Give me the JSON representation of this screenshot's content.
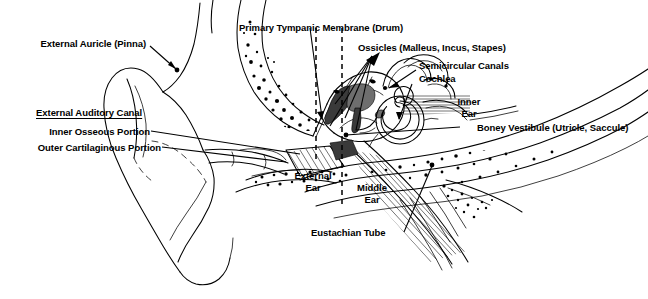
{
  "figure": {
    "background_color": "#ffffff",
    "ink_color": "#000000",
    "width": 648,
    "height": 299
  },
  "labels": {
    "external_auricle": "External Auricle (Pinna)",
    "external_auditory_canal": "External Auditory Canal",
    "inner_osseous_portion": "Inner Osseous Portion",
    "outer_cartilaginous_portion": "Outer Cartilaginous Portion",
    "primary_tympanic_membrane": "Primary Tympanic Membrane (Drum)",
    "ossicles": "Ossicles (Malleus, Incus, Stapes)",
    "semicircular_canals": "Semicircular Canals",
    "cochlea": "Cochlea",
    "inner_ear_line1": "Inner",
    "inner_ear_line2": "Ear",
    "boney_vestibule": "Boney Vestibule (Utricle, Saccule)",
    "external_ear_line1": "External",
    "external_ear_line2": "Ear",
    "middle_ear_line1": "Middle",
    "middle_ear_line2": "Ear",
    "eustachian_tube": "Eustachian Tube"
  },
  "regions": [
    {
      "name": "External Ear",
      "divider": "dashed-vertical"
    },
    {
      "name": "Middle Ear",
      "divider": "dashed-vertical"
    },
    {
      "name": "Inner Ear",
      "divider": "none"
    }
  ],
  "structures": [
    "External Auricle (Pinna)",
    "External Auditory Canal",
    "Inner Osseous Portion",
    "Outer Cartilaginous Portion",
    "Primary Tympanic Membrane (Drum)",
    "Ossicles (Malleus, Incus, Stapes)",
    "Semicircular Canals",
    "Cochlea",
    "Boney Vestibule (Utricle, Saccule)",
    "Eustachian Tube"
  ]
}
